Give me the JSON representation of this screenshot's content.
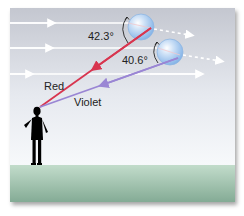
{
  "diagram": {
    "type": "rainbow-formation",
    "angles": {
      "red": "42.3°",
      "violet": "40.6°"
    },
    "labels": {
      "red": "Red",
      "violet": "Violet"
    },
    "colors": {
      "red_ray": "#d8354f",
      "violet_ray": "#9a86d4",
      "sunlight": "#ffffff",
      "droplet": "#9cc3ec",
      "sky_top": "#c6c9d2",
      "sky_bottom": "#f6f8fb",
      "ground_top": "#bcd8c6",
      "ground_bottom": "#86ae97",
      "observer": "#000000"
    }
  }
}
